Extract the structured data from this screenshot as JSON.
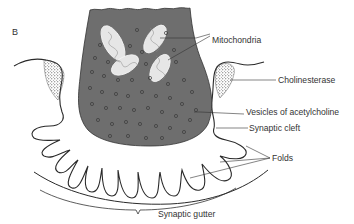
{
  "figure": {
    "panel_label": "B",
    "labels": {
      "mitochondria": "Mitochondria",
      "cholinesterase": "Cholinesterase",
      "vesicles": "Vesicles of acetylcholine",
      "synaptic_cleft": "Synaptic cleft",
      "folds": "Folds",
      "synaptic_gutter": "Synaptic gutter"
    },
    "colors": {
      "terminal_fill": "#6e6e6e",
      "line": "#2a2a2a",
      "mito_fill": "#e8e8e8",
      "background": "#ffffff"
    }
  }
}
